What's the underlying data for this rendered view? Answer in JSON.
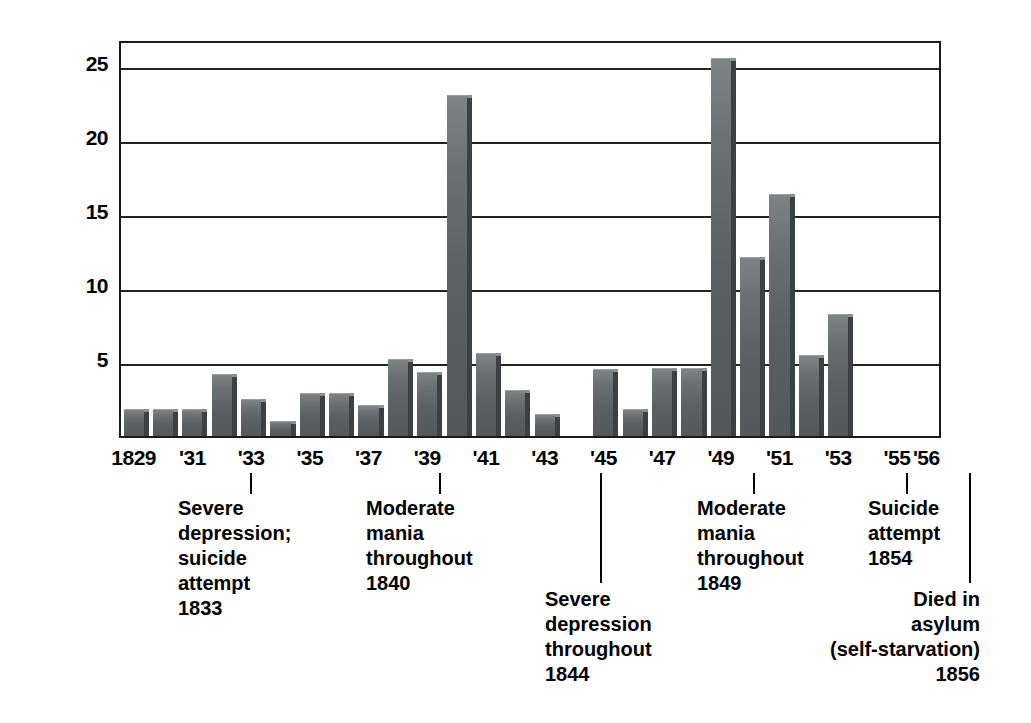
{
  "chart_data": {
    "type": "bar",
    "title": "",
    "xlabel": "",
    "ylabel": "Compositions",
    "ylim": [
      0,
      27
    ],
    "yticks": [
      5,
      10,
      15,
      20,
      25
    ],
    "grid": true,
    "legend": "none",
    "x_tick_labels": [
      "1829",
      "'31",
      "'33",
      "'35",
      "'37",
      "'39",
      "'41",
      "'43",
      "'45",
      "'47",
      "'49",
      "'51",
      "'53",
      "'55",
      "'56"
    ],
    "x_tick_years": [
      1829,
      1831,
      1833,
      1835,
      1837,
      1839,
      1841,
      1843,
      1845,
      1847,
      1849,
      1851,
      1853,
      1855,
      1856
    ],
    "categories": [
      1829,
      1830,
      1831,
      1832,
      1833,
      1834,
      1835,
      1836,
      1837,
      1838,
      1839,
      1840,
      1841,
      1842,
      1843,
      1844,
      1845,
      1846,
      1847,
      1848,
      1849,
      1850,
      1851,
      1852,
      1853,
      1854,
      1855,
      1856
    ],
    "values": [
      1.8,
      1.8,
      1.8,
      4.2,
      2.5,
      1.0,
      2.9,
      2.9,
      2.1,
      5.2,
      4.3,
      23.0,
      5.6,
      3.1,
      1.5,
      0,
      4.5,
      1.8,
      4.6,
      4.6,
      25.5,
      12.1,
      16.3,
      5.5,
      8.2,
      0,
      0,
      0
    ],
    "bar_color": "#5b6063",
    "bar_shadow_color": "#3b4043",
    "annotations": [
      {
        "year": 1833,
        "text": "Severe\ndepression;\nsuicide\nattempt\n1833",
        "align": "left"
      },
      {
        "year": 1840,
        "text": "Moderate\nmania\nthroughout\n1840",
        "align": "left"
      },
      {
        "year": 1844,
        "text": "Severe\ndepression\nthroughout\n1844",
        "align": "left"
      },
      {
        "year": 1849,
        "text": "Moderate\nmania\nthroughout\n1849",
        "align": "left"
      },
      {
        "year": 1854,
        "text": "Suicide\nattempt\n1854",
        "align": "left"
      },
      {
        "year": 1856,
        "text": "Died in\nasylum\n(self-starvation)\n1856",
        "align": "right"
      }
    ]
  },
  "axis": {
    "y_label": "Compositions",
    "y_tick_25": "25",
    "y_tick_20": "20",
    "y_tick_15": "15",
    "y_tick_10": "10",
    "y_tick_5": "5"
  },
  "x_labels": {
    "l0": "1829",
    "l1": "'31",
    "l2": "'33",
    "l3": "'35",
    "l4": "'37",
    "l5": "'39",
    "l6": "'41",
    "l7": "'43",
    "l8": "'45",
    "l9": "'47",
    "l10": "'49",
    "l11": "'51",
    "l12": "'53",
    "l13": "'55",
    "l14": "'56"
  },
  "notes": {
    "n1833": "Severe\ndepression;\nsuicide\nattempt\n1833",
    "n1840": "Moderate\nmania\nthroughout\n1840",
    "n1844": "Severe\ndepression\nthroughout\n1844",
    "n1849": "Moderate\nmania\nthroughout\n1849",
    "n1854": "Suicide\nattempt\n1854",
    "n1856": "Died in\nasylum\n(self-starvation)\n1856"
  }
}
